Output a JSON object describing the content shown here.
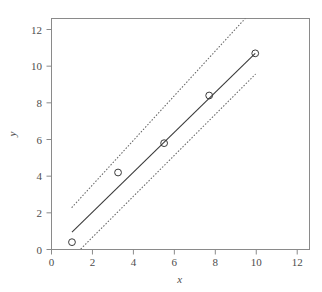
{
  "chart_data": {
    "type": "scatter",
    "title": "",
    "subtitle": "",
    "xlabel": "x",
    "ylabel": "y",
    "xlim": [
      0,
      12.6
    ],
    "ylim": [
      0,
      12.6
    ],
    "xticks": [
      0,
      2,
      4,
      6,
      8,
      10,
      12
    ],
    "yticks": [
      0,
      2,
      4,
      6,
      8,
      10,
      12
    ],
    "xtick_labels": [
      "0",
      "2",
      "4",
      "6",
      "8",
      "10",
      "12"
    ],
    "ytick_labels": [
      "0",
      "2",
      "4",
      "6",
      "8",
      "10",
      "12"
    ],
    "grid": false,
    "legend": "none",
    "background_color": "#ffffff",
    "axis_color": "#8a8a8a",
    "line_color": "#3a3a3a",
    "band_color": "#6b6b6b",
    "point_color": "#3a3a3a",
    "point_marker": "open-circle",
    "points": {
      "x": [
        1.0,
        3.25,
        5.5,
        7.7,
        9.95
      ],
      "y": [
        0.4,
        4.2,
        5.8,
        8.4,
        10.7
      ]
    },
    "series": [
      {
        "name": "fitted regression line",
        "style": "solid",
        "x": [
          1.0,
          9.95
        ],
        "y": [
          0.95,
          10.7
        ]
      },
      {
        "name": "upper confidence band",
        "style": "dotted",
        "x": [
          1.0,
          9.95
        ],
        "y": [
          2.3,
          13.2
        ]
      },
      {
        "name": "lower confidence band",
        "style": "dotted",
        "x": [
          1.0,
          9.95
        ],
        "y": [
          -0.45,
          9.55
        ]
      }
    ]
  },
  "axes": {
    "x_title": "x",
    "y_title": "y"
  }
}
